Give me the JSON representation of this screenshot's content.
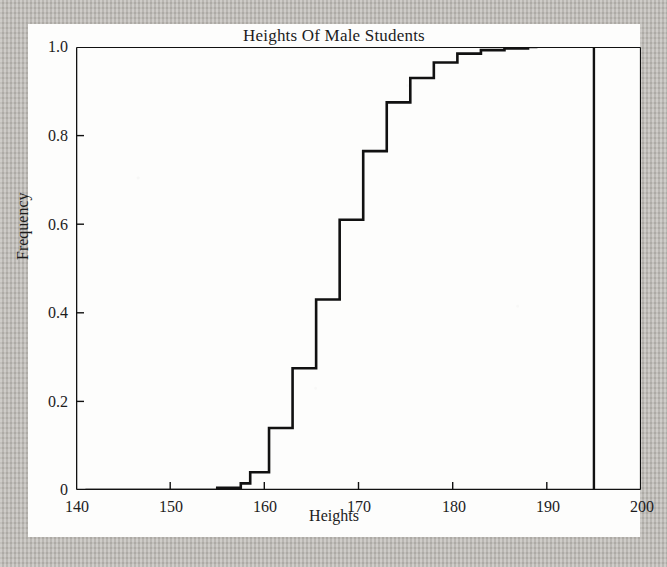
{
  "figure": {
    "title": "Heights Of Male Students",
    "background_color": "#fdfdfc",
    "page_background_color": "#bdbab5",
    "line_color": "#111111"
  },
  "chart_data": {
    "type": "line",
    "title": "Heights Of Male Students",
    "xlabel": "Heights",
    "ylabel": "Frequency",
    "xlim": [
      140,
      200
    ],
    "ylim": [
      0,
      1.0
    ],
    "grid": false,
    "legend": null,
    "drawstyle": "steps-post",
    "x_ticks": [
      140,
      150,
      160,
      170,
      180,
      190,
      200
    ],
    "x_tick_labels": [
      "140",
      "150",
      "160",
      "170",
      "180",
      "190",
      "200"
    ],
    "y_ticks": [
      0,
      0.2,
      0.4,
      0.6,
      0.8,
      1.0
    ],
    "y_tick_labels": [
      "0",
      "0.2",
      "0.4",
      "0.6",
      "0.8",
      "1.0"
    ],
    "series": [
      {
        "name": "Cumulative frequency",
        "x": [
          141.0,
          155.0,
          157.5,
          158.5,
          160.5,
          163.0,
          165.5,
          168.0,
          170.5,
          173.0,
          175.5,
          178.0,
          180.5,
          183.0,
          185.5,
          188.0,
          189.0
        ],
        "y": [
          0.0,
          0.005,
          0.015,
          0.04,
          0.14,
          0.275,
          0.43,
          0.61,
          0.765,
          0.875,
          0.93,
          0.965,
          0.985,
          0.993,
          0.997,
          1.0,
          1.0
        ]
      }
    ],
    "annotations": [
      {
        "type": "vertical-line",
        "x": 195,
        "y_from": 0,
        "y_to": 1.0,
        "label": ""
      }
    ]
  },
  "axes": {
    "x_label": "Heights",
    "y_label": "Frequency",
    "x_tick_labels": [
      "140",
      "150",
      "160",
      "170",
      "180",
      "190",
      "200"
    ],
    "y_tick_labels": [
      "1.0",
      "0.8",
      "0.6",
      "0.4",
      "0.2",
      "0"
    ]
  }
}
